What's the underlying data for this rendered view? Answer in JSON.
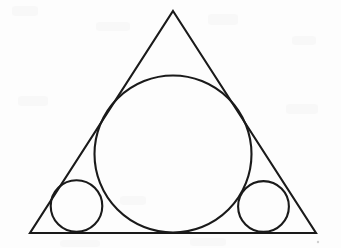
{
  "figure": {
    "canvas": {
      "width": 341,
      "height": 248
    },
    "background_color": "#fdfdfd",
    "stroke_color": "#1a1a1a",
    "fill_color": "none",
    "stroke_width": 2.1
  },
  "shapes": {
    "triangle": {
      "name": "outer-triangle",
      "kind": "polygon",
      "points": "173,11 316,233 30,233",
      "vertices": [
        {
          "label": "apex",
          "x": 173,
          "y": 11
        },
        {
          "label": "bottom-right",
          "x": 316,
          "y": 233
        },
        {
          "label": "bottom-left",
          "x": 30,
          "y": 233
        }
      ]
    },
    "incircle": {
      "name": "large-inscribed-circle",
      "kind": "circle",
      "cx": 173,
      "cy": 154,
      "r": 78.5
    },
    "left_circle": {
      "name": "left-small-circle",
      "kind": "circle",
      "cx": 76.5,
      "cy": 206,
      "r": 25.8
    },
    "right_circle": {
      "name": "right-small-circle",
      "kind": "circle",
      "cx": 263.5,
      "cy": 206.5,
      "r": 25.4
    }
  },
  "artifacts": {
    "speck": {
      "name": "scan-speck",
      "cx": 318,
      "cy": 242,
      "r": 1.2,
      "color": "#cfcfcf"
    }
  }
}
